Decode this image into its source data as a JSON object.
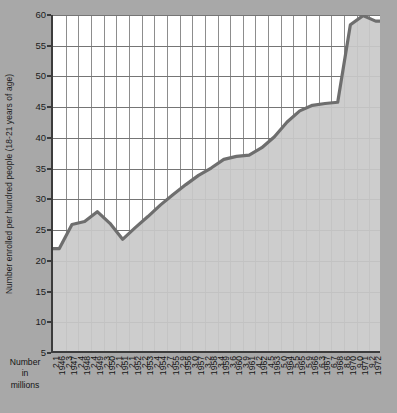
{
  "chart_data": {
    "type": "area",
    "title": "",
    "xlabel": "Number in millions",
    "ylabel": "Number enrolled per hundred people (18-21 years of age)",
    "ylim": [
      5,
      60
    ],
    "ytick_step": 5,
    "ytick_labels": [
      "60",
      "55",
      "50",
      "45",
      "40",
      "35",
      "30",
      "25",
      "20",
      "15",
      "10",
      "5"
    ],
    "ytick_values": [
      60,
      55,
      50,
      45,
      40,
      35,
      30,
      25,
      20,
      15,
      10,
      5
    ],
    "grid": "both",
    "legend": "none",
    "categories": [
      "1946",
      "1947",
      "1948",
      "1949",
      "1950",
      "1951",
      "1952",
      "1953",
      "1954",
      "1955",
      "1956",
      "1957",
      "1958",
      "1959",
      "1960",
      "1961",
      "1962",
      "1963",
      "1964",
      "1965",
      "1966",
      "1967",
      "1968",
      "1970",
      "1971",
      "1972"
    ],
    "secondary_axis_label": "Number in millions",
    "secondary_values": [
      "2.1",
      "2.3",
      "2.4",
      "2.4",
      "2.3",
      "2.1",
      "2.1",
      "2.2",
      "2.4",
      "2.7",
      "2.9",
      "3.0",
      "3.2",
      "3.4",
      "3.6",
      "3.9",
      "4.2",
      "4.5",
      "5.0",
      "5.5",
      "5.9",
      "6.3",
      "6.7",
      "8.6",
      "9.0",
      "9.2"
    ],
    "series": [
      {
        "name": "Number enrolled per hundred people (18-21 years of age)",
        "values": [
          22.0,
          25.9,
          26.4,
          28.0,
          26.1,
          23.5,
          25.4,
          27.2,
          29.1,
          30.8,
          32.4,
          33.9,
          35.1,
          36.5,
          37.0,
          37.2,
          38.4,
          40.2,
          42.6,
          44.4,
          45.3,
          45.6,
          45.8,
          58.4,
          59.9,
          59.0
        ]
      }
    ]
  },
  "axis": {
    "y_label": "Number enrolled per hundred people (18-21 years of age)",
    "x_series_label_lines": [
      "Number",
      "in",
      "millions"
    ]
  },
  "colors": {
    "figure_background": "#a8a8a8",
    "plot_background": "#ffffff",
    "area_fill": "#c9c9c9",
    "line": "#6e6e6e",
    "axis": "#3c3c3c",
    "grid": "#8d8d8d",
    "text": "#141414"
  }
}
